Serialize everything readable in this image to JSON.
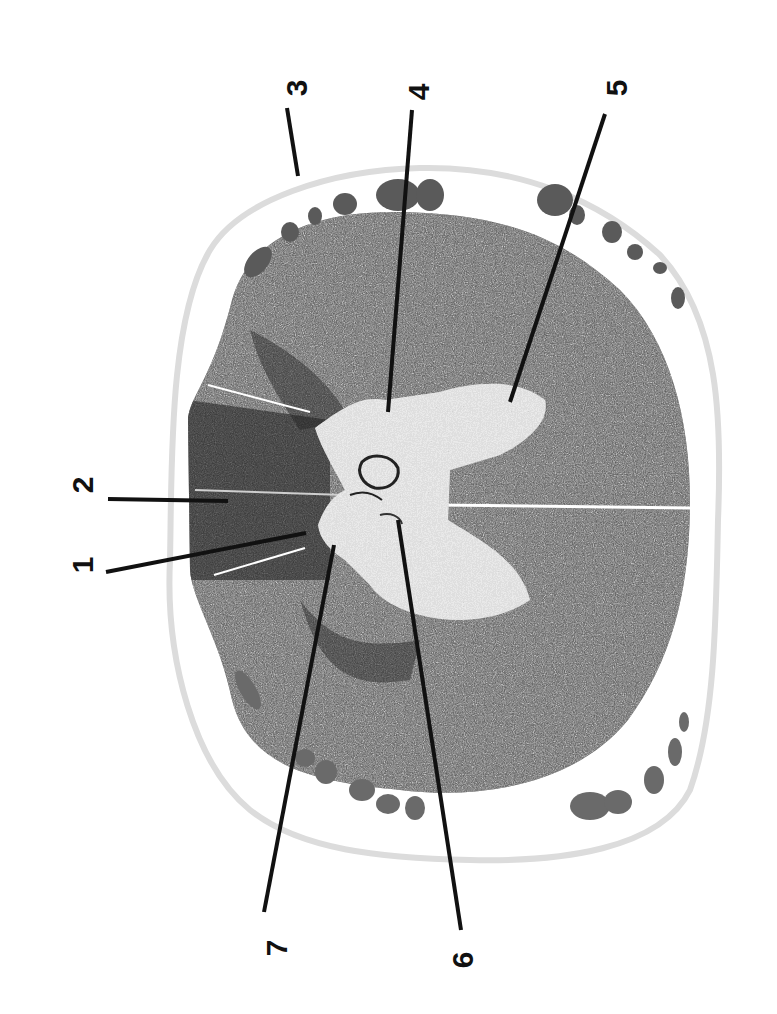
{
  "figure": {
    "kind": "spinal cord transverse section (rotated 90°)",
    "background": "#ffffff",
    "colors": {
      "outer_membrane": "#d9d9d9",
      "tissue_dark": "#3a3a3a",
      "tissue_mid": "#6b6b6b",
      "grey_matter_light": "#d8d8d8",
      "rootlets": "#555555",
      "leader_lines": "#111111"
    }
  },
  "labels": [
    {
      "id": "1",
      "text": "1",
      "x": 82,
      "y": 565,
      "rotate": -90,
      "line": {
        "x1": 106,
        "y1": 572,
        "x2": 306,
        "y2": 533
      }
    },
    {
      "id": "2",
      "text": "2",
      "x": 82,
      "y": 485,
      "rotate": -90,
      "line": {
        "x1": 108,
        "y1": 499,
        "x2": 228,
        "y2": 501
      }
    },
    {
      "id": "3",
      "text": "3",
      "x": 296,
      "y": 88,
      "rotate": -90,
      "line": {
        "x1": 287,
        "y1": 108,
        "x2": 298,
        "y2": 176
      }
    },
    {
      "id": "4",
      "text": "4",
      "x": 418,
      "y": 92,
      "rotate": -90,
      "line": {
        "x1": 412,
        "y1": 110,
        "x2": 388,
        "y2": 412
      }
    },
    {
      "id": "5",
      "text": "5",
      "x": 616,
      "y": 88,
      "rotate": -90,
      "line": {
        "x1": 605,
        "y1": 114,
        "x2": 510,
        "y2": 402
      }
    },
    {
      "id": "6",
      "text": "6",
      "x": 462,
      "y": 960,
      "rotate": -90,
      "line": {
        "x1": 461,
        "y1": 930,
        "x2": 398,
        "y2": 520
      }
    },
    {
      "id": "7",
      "text": "7",
      "x": 276,
      "y": 948,
      "rotate": -90,
      "line": {
        "x1": 264,
        "y1": 912,
        "x2": 334,
        "y2": 545
      }
    }
  ]
}
